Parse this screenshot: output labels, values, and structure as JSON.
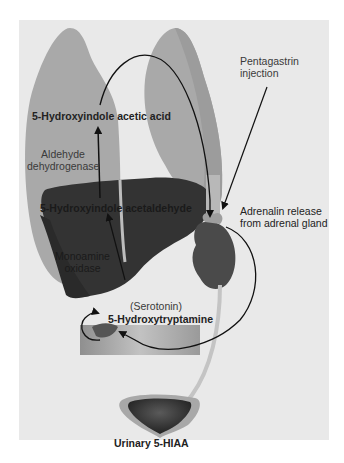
{
  "diagram": {
    "labels": {
      "hiaa": "5-Hydroxyindole acetic acid",
      "aldehyde_dehydrogenase_1": "Aldehyde",
      "aldehyde_dehydrogenase_2": "dehydrogenase",
      "acetaldehyde": "5-Hydroxyindole acetaldehyde",
      "mao_1": "Monoamine",
      "mao_2": "oxidase",
      "serotonin": "(Serotonin)",
      "hydroxytryptamine": "5-Hydroxytryptamine",
      "pentagastrin_1": "Pentagastrin",
      "pentagastrin_2": "injection",
      "adrenalin_1": "Adrenalin release",
      "adrenalin_2": "from adrenal gland",
      "urinary": "Urinary 5-HIAA"
    },
    "colors": {
      "background": "#e9e9e9",
      "lung": "#a9a9a9",
      "liver": "#333333",
      "kidney": "#4a4a4a",
      "gut": "#b5b5b5",
      "arrow": "#111111"
    }
  }
}
